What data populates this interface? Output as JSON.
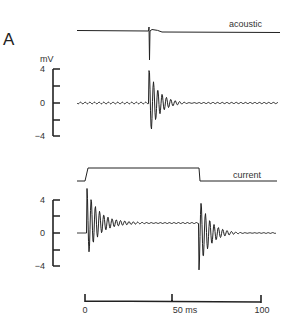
{
  "panel_label": "A",
  "traces": {
    "acoustic_label": "acoustic",
    "current_label": "current"
  },
  "voltage_axis": {
    "unit": "mV",
    "ticks": [
      "4",
      "0",
      "−4"
    ]
  },
  "time_axis": {
    "ticks": [
      "0",
      "50 ms",
      "100"
    ]
  },
  "chart_data": {
    "type": "line",
    "title": "A",
    "xlabel": "Time (ms)",
    "ylabel": "mV",
    "xlim": [
      0,
      100
    ],
    "ylim": [
      -4,
      4
    ],
    "grid": false,
    "series": [
      {
        "name": "acoustic",
        "description": "Stimulus monitor: brief click at ~37 ms",
        "events": [
          {
            "t_ms": 37,
            "type": "click"
          }
        ]
      },
      {
        "name": "response to acoustic (mV)",
        "description": "Damped oscillation after click; peak ~+3.8 mV / -4 mV, decays over ~25 ms; baseline ~0 mV with small ripple",
        "onset_ms": 37,
        "peak_mV": 3.8,
        "trough_mV": -4.0
      },
      {
        "name": "current",
        "description": "Rectangular current step",
        "step_on_ms": 1,
        "step_off_ms": 65
      },
      {
        "name": "response to current (mV)",
        "description": "Damped oscillation at step onset (peak ~+4.5 mV) settling to ~+1.2 mV, and at step offset (trough ~-4.2 mV) returning to 0",
        "on_peak_mV": 4.5,
        "plateau_mV": 1.2,
        "off_trough_mV": -4.2
      }
    ]
  }
}
